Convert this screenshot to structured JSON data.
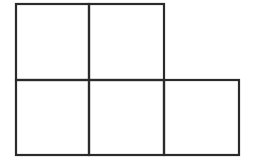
{
  "diagram": {
    "type": "square-grid-figure",
    "stroke_color": "#2b2b2b",
    "background": "#ffffff",
    "rows": [
      {
        "row": 1,
        "squares": [
          1,
          2
        ]
      },
      {
        "row": 2,
        "squares": [
          1,
          2,
          3
        ]
      }
    ],
    "square_count": 5
  }
}
